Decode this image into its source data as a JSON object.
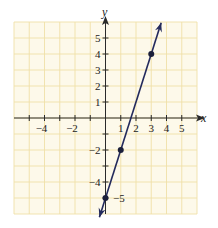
{
  "chart_data": {
    "type": "line",
    "title": "",
    "xlabel": "x",
    "ylabel": "y",
    "xlim": [
      -6,
      6
    ],
    "ylim": [
      -6,
      6
    ],
    "grid": true,
    "x_tick_labels": [
      "-4",
      "-2",
      "1",
      "2",
      "3",
      "4",
      "5"
    ],
    "y_tick_labels": [
      "5",
      "4",
      "3",
      "2",
      "1",
      "-2",
      "-4",
      "-5"
    ],
    "series": [
      {
        "name": "y = 3x - 5",
        "equation": "y = 3x - 5",
        "slope": 3,
        "intercept": -5,
        "points": [
          [
            0,
            -5
          ],
          [
            1,
            -2
          ],
          [
            3,
            4
          ]
        ],
        "arrows_both_ends": true
      }
    ],
    "colors": {
      "grid": "#efe0a8",
      "grid_background": "#fdf9ea",
      "line": "#232a5c",
      "axes": "#2a2a2a"
    }
  },
  "labels": {
    "x_axis": "x",
    "y_axis": "y",
    "x_ticks": [
      {
        "v": -4,
        "t": "−4"
      },
      {
        "v": -2,
        "t": "−2"
      },
      {
        "v": 1,
        "t": "1"
      },
      {
        "v": 2,
        "t": "2"
      },
      {
        "v": 3,
        "t": "3"
      },
      {
        "v": 4,
        "t": "4"
      },
      {
        "v": 5,
        "t": "5"
      }
    ],
    "y_ticks": [
      {
        "v": 5,
        "t": "5"
      },
      {
        "v": 4,
        "t": "4"
      },
      {
        "v": 3,
        "t": "3"
      },
      {
        "v": 2,
        "t": "2"
      },
      {
        "v": 1,
        "t": "1"
      },
      {
        "v": -2,
        "t": "−2"
      },
      {
        "v": -4,
        "t": "−4"
      }
    ],
    "intercept_label": "−5"
  }
}
